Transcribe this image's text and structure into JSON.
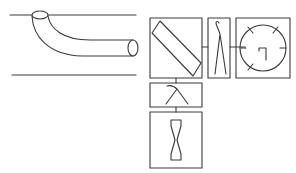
{
  "diagram": {
    "title": "",
    "stroke_color": "#3a3a3a",
    "background": "#ffffff",
    "components": [
      {
        "id": "pipe-section",
        "kind": "bent-pipe-between-parallel-lines"
      },
      {
        "id": "mirror-box",
        "kind": "diagonal-plate"
      },
      {
        "id": "lambda-box",
        "kind": "lambda-symbol"
      },
      {
        "id": "dial-box",
        "kind": "circular-dial"
      },
      {
        "id": "hook-box",
        "kind": "hook-lambda-symbol"
      },
      {
        "id": "hourglass-box",
        "kind": "hourglass-constriction"
      }
    ],
    "connections": [
      {
        "from": "mirror-box",
        "to": "lambda-box"
      },
      {
        "from": "lambda-box",
        "to": "dial-box"
      },
      {
        "from": "mirror-box",
        "to": "hook-box"
      },
      {
        "from": "hook-box",
        "to": "hourglass-box"
      }
    ]
  }
}
